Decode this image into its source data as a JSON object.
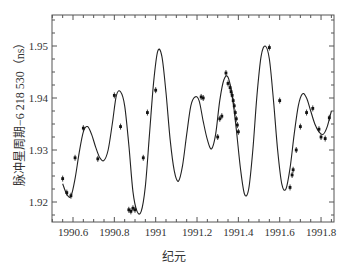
{
  "chart_data": {
    "type": "line",
    "title": "",
    "xlabel": "纪元",
    "ylabel": "脉冲星周期−6 218 530（ns）",
    "xlim": [
      1990.5,
      1991.86
    ],
    "ylim": [
      1.9155,
      1.9565
    ],
    "x_ticks": [
      1990.6,
      1990.8,
      1991,
      1991.2,
      1991.4,
      1991.6,
      1991.8
    ],
    "x_tick_labels": [
      "1990.6",
      "1990.8",
      "1991",
      "1991.2",
      "1991.4",
      "1991.6",
      "1991.8"
    ],
    "y_ticks": [
      1.92,
      1.93,
      1.94,
      1.95
    ],
    "y_tick_labels": [
      "1.92",
      "1.93",
      "1.94",
      "1.95"
    ],
    "grid": false,
    "legend": null,
    "series": [
      {
        "name": "fit curve",
        "style": "solid line",
        "x": [
          1990.55,
          1990.57,
          1990.59,
          1990.61,
          1990.63,
          1990.65,
          1990.67,
          1990.69,
          1990.71,
          1990.73,
          1990.75,
          1990.77,
          1990.79,
          1990.81,
          1990.83,
          1990.85,
          1990.87,
          1990.89,
          1990.91,
          1990.93,
          1990.95,
          1990.97,
          1990.99,
          1991.01,
          1991.03,
          1991.05,
          1991.07,
          1991.09,
          1991.11,
          1991.13,
          1991.15,
          1991.17,
          1991.19,
          1991.21,
          1991.23,
          1991.25,
          1991.27,
          1991.29,
          1991.31,
          1991.33,
          1991.35,
          1991.37,
          1991.39,
          1991.41,
          1991.43,
          1991.45,
          1991.47,
          1991.49,
          1991.51,
          1991.53,
          1991.55,
          1991.57,
          1991.59,
          1991.61,
          1991.63,
          1991.65,
          1991.67,
          1991.69,
          1991.71,
          1991.73,
          1991.75,
          1991.77,
          1991.79,
          1991.81,
          1991.83,
          1991.85
        ],
        "y": [
          1.9235,
          1.9215,
          1.9211,
          1.9245,
          1.9295,
          1.9335,
          1.9345,
          1.933,
          1.9305,
          1.9285,
          1.928,
          1.93,
          1.935,
          1.9405,
          1.9412,
          1.9385,
          1.931,
          1.922,
          1.9182,
          1.9182,
          1.923,
          1.933,
          1.943,
          1.949,
          1.948,
          1.941,
          1.932,
          1.926,
          1.924,
          1.927,
          1.933,
          1.9385,
          1.9402,
          1.9395,
          1.9355,
          1.932,
          1.9302,
          1.933,
          1.9395,
          1.9435,
          1.944,
          1.9405,
          1.934,
          1.9265,
          1.9215,
          1.9225,
          1.93,
          1.9405,
          1.948,
          1.95,
          1.9475,
          1.9395,
          1.93,
          1.9235,
          1.9225,
          1.9265,
          1.933,
          1.9385,
          1.9408,
          1.94,
          1.9375,
          1.935,
          1.9335,
          1.933,
          1.9345,
          1.9375
        ]
      },
      {
        "name": "observations",
        "style": "points with error bars",
        "x": [
          1990.55,
          1990.57,
          1990.59,
          1990.61,
          1990.65,
          1990.72,
          1990.8,
          1990.83,
          1990.87,
          1990.88,
          1990.89,
          1990.9,
          1990.94,
          1990.96,
          1991.0,
          1991.22,
          1991.23,
          1991.3,
          1991.31,
          1991.32,
          1991.34,
          1991.35,
          1991.36,
          1991.365,
          1991.37,
          1991.375,
          1991.38,
          1991.385,
          1991.39,
          1991.395,
          1991.4,
          1991.55,
          1991.6,
          1991.65,
          1991.66,
          1991.665,
          1991.68,
          1991.7,
          1991.73,
          1991.76,
          1991.79,
          1991.8,
          1991.82,
          1991.84
        ],
        "y": [
          1.9245,
          1.9218,
          1.9212,
          1.9285,
          1.9342,
          1.9283,
          1.9405,
          1.9345,
          1.9185,
          1.9182,
          1.9188,
          1.9185,
          1.9285,
          1.9372,
          1.9415,
          1.9402,
          1.94,
          1.9325,
          1.936,
          1.9365,
          1.9448,
          1.9428,
          1.942,
          1.9412,
          1.9405,
          1.9395,
          1.9385,
          1.9372,
          1.936,
          1.9348,
          1.9335,
          1.9497,
          1.9395,
          1.9228,
          1.9252,
          1.9262,
          1.93,
          1.9345,
          1.9372,
          1.938,
          1.934,
          1.9325,
          1.9322,
          1.9362
        ]
      }
    ]
  }
}
